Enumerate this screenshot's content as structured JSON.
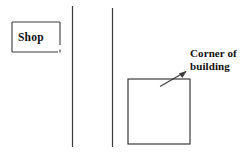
{
  "diagram": {
    "background_color": "#ffffff",
    "ink_color": "#3a3a3a",
    "labels": {
      "shop": "Shop",
      "corner_line1": "Corner of",
      "corner_line2": "building"
    },
    "shapes": {
      "shop_box": {
        "x": 12,
        "y": 22,
        "width": 48,
        "height": 30
      },
      "building_box": {
        "x": 128,
        "y": 79,
        "width": 62,
        "height": 65
      },
      "road_line_left": {
        "x": 72,
        "y1": 6,
        "y2": 147
      },
      "road_line_right": {
        "x": 112,
        "y1": 8,
        "y2": 147
      },
      "leader_arrow": {
        "x1": 160,
        "y1": 86,
        "x2": 186,
        "y2": 72
      }
    }
  }
}
